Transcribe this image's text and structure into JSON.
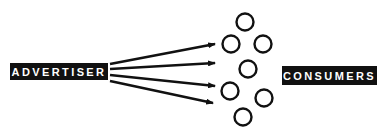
{
  "diagram": {
    "source_label": "ADVERTISER",
    "target_label": "CONSUMERS",
    "arrows": [
      {
        "x1": 110,
        "y1": 64,
        "x2": 215,
        "y2": 44
      },
      {
        "x1": 110,
        "y1": 69,
        "x2": 215,
        "y2": 63
      },
      {
        "x1": 110,
        "y1": 75,
        "x2": 215,
        "y2": 86
      },
      {
        "x1": 110,
        "y1": 81,
        "x2": 213,
        "y2": 103
      }
    ],
    "consumers": [
      {
        "cx": 245,
        "cy": 22
      },
      {
        "cx": 231,
        "cy": 44
      },
      {
        "cx": 263,
        "cy": 44
      },
      {
        "cx": 248,
        "cy": 69
      },
      {
        "cx": 230,
        "cy": 91
      },
      {
        "cx": 264,
        "cy": 98
      },
      {
        "cx": 243,
        "cy": 117
      }
    ],
    "colors": {
      "ink": "#111111",
      "background": "#ffffff"
    }
  }
}
